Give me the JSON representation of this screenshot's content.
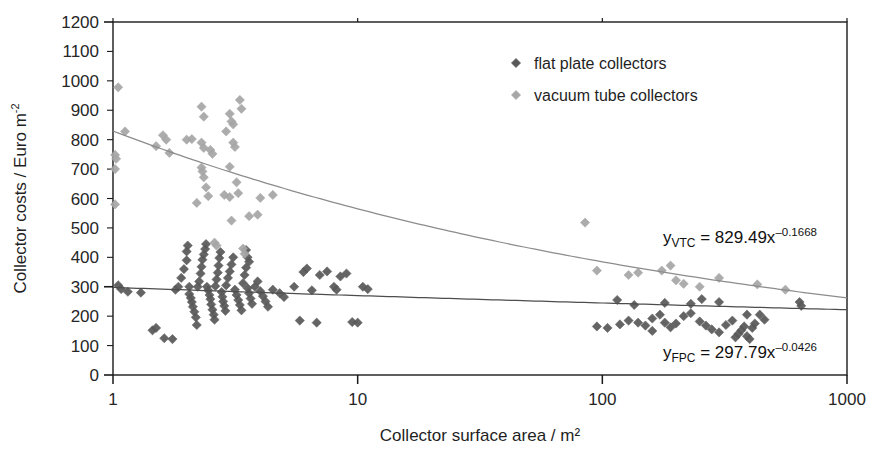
{
  "chart_data": {
    "type": "scatter",
    "title": "",
    "xlabel": "Collector surface area / m²",
    "ylabel": "Collector costs / Euro m",
    "ylabel_sup": "-2",
    "xscale": "log",
    "yscale": "linear",
    "xlim": [
      1,
      1000
    ],
    "ylim": [
      0,
      1200
    ],
    "xticks": [
      "1",
      "10",
      "100",
      "1000"
    ],
    "xtick_values": [
      1,
      10,
      100,
      1000
    ],
    "yticks": [
      "0",
      "100",
      "200",
      "300",
      "400",
      "500",
      "600",
      "700",
      "800",
      "900",
      "1000",
      "1100",
      "1200"
    ],
    "ytick_values": [
      0,
      100,
      200,
      300,
      400,
      500,
      600,
      700,
      800,
      900,
      1000,
      1100,
      1200
    ],
    "grid": false,
    "legend_position": "top-right",
    "marker": "diamond",
    "series": [
      {
        "name": "flat plate collectors",
        "color": "#595959",
        "trend_color": "#4d4d4d",
        "trend_label": "y_FPC = 297.79x^-0.0426",
        "trend_coef": 297.79,
        "trend_exp": -0.0426,
        "points": [
          [
            1.05,
            305
          ],
          [
            1.08,
            292
          ],
          [
            1.15,
            283
          ],
          [
            1.3,
            280
          ],
          [
            1.45,
            152
          ],
          [
            1.5,
            160
          ],
          [
            1.62,
            125
          ],
          [
            1.75,
            122
          ],
          [
            1.8,
            290
          ],
          [
            1.85,
            300
          ],
          [
            1.9,
            330
          ],
          [
            1.95,
            360
          ],
          [
            2.0,
            390
          ],
          [
            2.0,
            420
          ],
          [
            2.02,
            440
          ],
          [
            2.05,
            300
          ],
          [
            2.05,
            275
          ],
          [
            2.08,
            262
          ],
          [
            2.1,
            248
          ],
          [
            2.12,
            232
          ],
          [
            2.15,
            215
          ],
          [
            2.18,
            196
          ],
          [
            2.2,
            170
          ],
          [
            2.22,
            300
          ],
          [
            2.25,
            318
          ],
          [
            2.28,
            345
          ],
          [
            2.3,
            368
          ],
          [
            2.32,
            392
          ],
          [
            2.35,
            410
          ],
          [
            2.38,
            428
          ],
          [
            2.4,
            445
          ],
          [
            2.42,
            300
          ],
          [
            2.45,
            288
          ],
          [
            2.48,
            272
          ],
          [
            2.5,
            258
          ],
          [
            2.52,
            240
          ],
          [
            2.55,
            222
          ],
          [
            2.58,
            205
          ],
          [
            2.6,
            188
          ],
          [
            2.62,
            302
          ],
          [
            2.65,
            325
          ],
          [
            2.68,
            348
          ],
          [
            2.7,
            372
          ],
          [
            2.72,
            398
          ],
          [
            2.75,
            418
          ],
          [
            2.78,
            282
          ],
          [
            2.8,
            266
          ],
          [
            2.82,
            250
          ],
          [
            2.85,
            235
          ],
          [
            2.88,
            218
          ],
          [
            2.9,
            305
          ],
          [
            2.95,
            330
          ],
          [
            3.0,
            352
          ],
          [
            3.05,
            376
          ],
          [
            3.1,
            400
          ],
          [
            3.15,
            290
          ],
          [
            3.2,
            272
          ],
          [
            3.25,
            255
          ],
          [
            3.3,
            238
          ],
          [
            3.35,
            220
          ],
          [
            3.4,
            312
          ],
          [
            3.45,
            340
          ],
          [
            3.5,
            365
          ],
          [
            3.55,
            295
          ],
          [
            3.6,
            278
          ],
          [
            3.65,
            260
          ],
          [
            3.7,
            242
          ],
          [
            3.8,
            300
          ],
          [
            3.9,
            318
          ],
          [
            4.0,
            285
          ],
          [
            4.1,
            268
          ],
          [
            4.2,
            250
          ],
          [
            4.3,
            232
          ],
          [
            3.5,
            425
          ],
          [
            3.55,
            400
          ],
          [
            3.6,
            385
          ],
          [
            4.5,
            290
          ],
          [
            4.8,
            278
          ],
          [
            5.0,
            265
          ],
          [
            5.5,
            300
          ],
          [
            5.8,
            185
          ],
          [
            6.0,
            350
          ],
          [
            6.2,
            362
          ],
          [
            6.5,
            288
          ],
          [
            6.8,
            178
          ],
          [
            7.0,
            340
          ],
          [
            7.5,
            352
          ],
          [
            8.0,
            300
          ],
          [
            8.2,
            290
          ],
          [
            8.5,
            335
          ],
          [
            9.0,
            345
          ],
          [
            9.5,
            180
          ],
          [
            10.0,
            178
          ],
          [
            10.5,
            300
          ],
          [
            11.0,
            292
          ],
          [
            95,
            165
          ],
          [
            105,
            160
          ],
          [
            118,
            172
          ],
          [
            128,
            185
          ],
          [
            140,
            178
          ],
          [
            150,
            168
          ],
          [
            160,
            192
          ],
          [
            172,
            205
          ],
          [
            180,
            178
          ],
          [
            190,
            162
          ],
          [
            200,
            175
          ],
          [
            215,
            200
          ],
          [
            230,
            210
          ],
          [
            250,
            182
          ],
          [
            265,
            168
          ],
          [
            280,
            155
          ],
          [
            300,
            145
          ],
          [
            320,
            170
          ],
          [
            340,
            185
          ],
          [
            350,
            128
          ],
          [
            360,
            140
          ],
          [
            370,
            152
          ],
          [
            380,
            165
          ],
          [
            390,
            132
          ],
          [
            400,
            122
          ],
          [
            410,
            160
          ],
          [
            420,
            175
          ],
          [
            440,
            205
          ],
          [
            460,
            188
          ],
          [
            135,
            238
          ],
          [
            180,
            245
          ],
          [
            230,
            242
          ],
          [
            300,
            248
          ],
          [
            390,
            205
          ],
          [
            640,
            248
          ],
          [
            650,
            235
          ],
          [
            255,
            258
          ],
          [
            115,
            255
          ],
          [
            160,
            150
          ]
        ]
      },
      {
        "name": "vacuum tube collectors",
        "color": "#a6a6a6",
        "trend_color": "#8c8c8c",
        "trend_label": "y_VTC = 829.49x^-0.1668",
        "trend_coef": 829.49,
        "trend_exp": -0.1668,
        "points": [
          [
            1.05,
            978
          ],
          [
            1.02,
            748
          ],
          [
            1.03,
            735
          ],
          [
            1.02,
            700
          ],
          [
            1.02,
            580
          ],
          [
            1.12,
            828
          ],
          [
            1.6,
            815
          ],
          [
            1.65,
            800
          ],
          [
            1.5,
            778
          ],
          [
            1.7,
            755
          ],
          [
            2.0,
            800
          ],
          [
            2.1,
            802
          ],
          [
            2.3,
            912
          ],
          [
            2.35,
            878
          ],
          [
            2.3,
            790
          ],
          [
            2.35,
            772
          ],
          [
            2.5,
            765
          ],
          [
            2.55,
            752
          ],
          [
            2.3,
            705
          ],
          [
            2.32,
            692
          ],
          [
            2.35,
            672
          ],
          [
            2.4,
            638
          ],
          [
            2.2,
            585
          ],
          [
            2.45,
            608
          ],
          [
            3.0,
            888
          ],
          [
            3.05,
            862
          ],
          [
            3.1,
            852
          ],
          [
            3.3,
            935
          ],
          [
            3.35,
            905
          ],
          [
            2.9,
            828
          ],
          [
            3.1,
            790
          ],
          [
            3.15,
            775
          ],
          [
            3.0,
            708
          ],
          [
            3.2,
            655
          ],
          [
            3.25,
            618
          ],
          [
            3.0,
            605
          ],
          [
            2.85,
            612
          ],
          [
            3.05,
            525
          ],
          [
            3.6,
            540
          ],
          [
            4.0,
            602
          ],
          [
            4.5,
            612
          ],
          [
            3.9,
            545
          ],
          [
            85,
            518
          ],
          [
            95,
            355
          ],
          [
            128,
            340
          ],
          [
            140,
            348
          ],
          [
            190,
            372
          ],
          [
            200,
            322
          ],
          [
            215,
            310
          ],
          [
            430,
            308
          ],
          [
            560,
            290
          ],
          [
            300,
            330
          ],
          [
            250,
            300
          ],
          [
            175,
            355
          ],
          [
            2.6,
            450
          ],
          [
            2.65,
            440
          ],
          [
            3.4,
            430
          ],
          [
            3.45,
            412
          ]
        ]
      }
    ],
    "annotations": [
      {
        "name": "vtc-equation",
        "text": "y_VTC = 829.49x^-0.1668",
        "base": "y",
        "sub": "VTC",
        "body": " = 829.49x",
        "sup": "-0.1668"
      },
      {
        "name": "fpc-equation",
        "text": "y_FPC = 297.79x^-0.0426",
        "base": "y",
        "sub": "FPC",
        "body": " = 297.79x",
        "sup": "-0.0426"
      }
    ]
  },
  "legend": {
    "items": [
      {
        "label": "flat plate collectors",
        "color": "#595959"
      },
      {
        "label": "vacuum tube collectors",
        "color": "#a6a6a6"
      }
    ]
  },
  "axes": {
    "x_title": "Collector surface area / m²",
    "y_title_main": "Collector costs  / Euro  m",
    "y_title_sup": "-2"
  },
  "equations": {
    "vtc": {
      "base": "y",
      "sub": "VTC",
      "body": " = 829.49x",
      "sup": "–0.1668"
    },
    "fpc": {
      "base": "y",
      "sub": "FPC",
      "body": " = 297.79x",
      "sup": "–0.0426"
    }
  },
  "colors": {
    "fpc_marker": "#595959",
    "vtc_marker": "#a6a6a6",
    "fpc_line": "#4d4d4d",
    "vtc_line": "#8c8c8c",
    "axis": "#1a1a1a"
  }
}
